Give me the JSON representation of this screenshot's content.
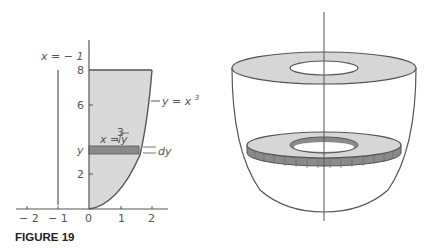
{
  "figure": {
    "caption": "FIGURE 19",
    "left_plot": {
      "x_ticks": [
        "− 2",
        "− 1",
        "0",
        "1",
        "2"
      ],
      "y_ticks": [
        "2",
        "6",
        "8"
      ],
      "y_band_label": "y",
      "vertical_line_label": "x = − 1",
      "curve_label": "y = x",
      "curve_label_exp": "3",
      "band_label_prefix": "x =",
      "band_label_root_index": "3",
      "band_label_radicand": "y",
      "band_width_label": "dy"
    },
    "right_solid": {
      "description": "solid of revolution with washer slice"
    }
  },
  "colors": {
    "region_fill": "#d9d9d9",
    "band_fill": "#8a8a8a",
    "line": "#555555",
    "washer_fill": "#d6d6d6"
  }
}
